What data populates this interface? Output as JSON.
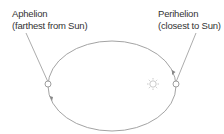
{
  "diagram": {
    "aphelion": {
      "title": "Aphelion",
      "subtitle": "(farthest from Sun)"
    },
    "perihelion": {
      "title": "Perihelion",
      "subtitle": "(closest to Sun)"
    },
    "colors": {
      "orbit": "#999999",
      "text": "#333333",
      "sun": "#bbbbbb"
    }
  }
}
